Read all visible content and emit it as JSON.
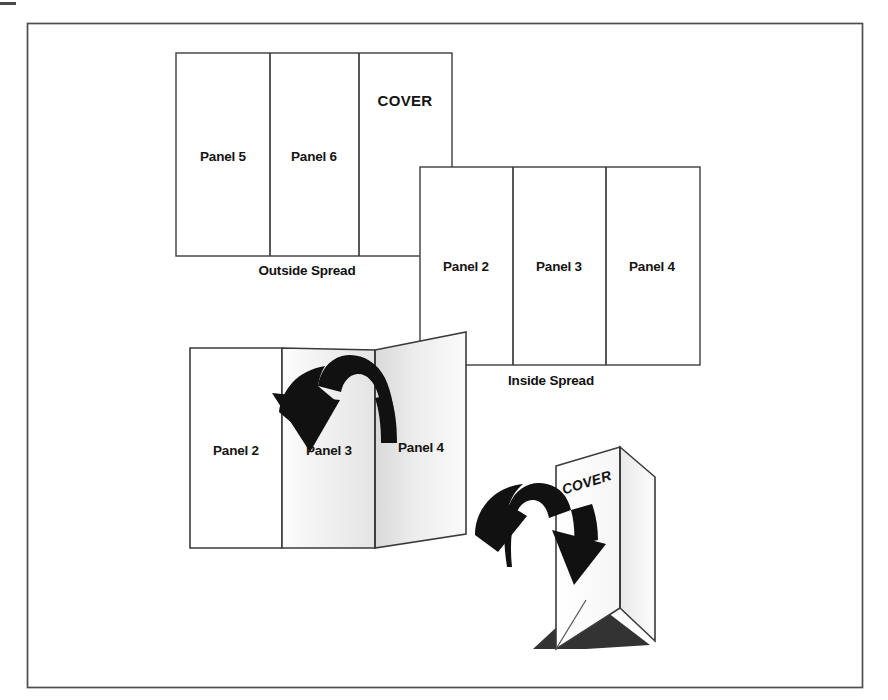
{
  "figure": {
    "frame": {
      "name": "outer-border",
      "x": 27,
      "y": 23,
      "width": 836,
      "height": 665,
      "stroke_color": "#4d4d4d"
    },
    "corner_tick": {
      "name": "crop-mark",
      "x": 0,
      "y": 2,
      "width": 16,
      "height": 3
    }
  },
  "outside_spread": {
    "caption": "Outside Spread",
    "panels": [
      {
        "label": "Panel 5"
      },
      {
        "label": "Panel 6"
      },
      {
        "label": "COVER"
      }
    ]
  },
  "inside_spread": {
    "caption": "Inside Spread",
    "panels": [
      {
        "label": "Panel 2"
      },
      {
        "label": "Panel 3"
      },
      {
        "label": "Panel 4"
      }
    ]
  },
  "folding_step_1": {
    "panels": [
      {
        "label": "Panel 2"
      },
      {
        "label": "Panel 3"
      },
      {
        "label": "Panel 4"
      }
    ],
    "arrow": {
      "name": "fold-arrow",
      "direction": "curved-down-left"
    }
  },
  "folding_step_2": {
    "cover_label": "COVER",
    "arrow": {
      "name": "fold-arrow",
      "direction": "curved-down-right"
    }
  },
  "colors": {
    "line": "#3b3b3b",
    "frame": "#4d4d4d",
    "ink": "#111111",
    "panel_fill": "#ffffff",
    "shade_light": "#f2f2f2",
    "shade_mid": "#dcdcdc",
    "shadow": "#333333"
  }
}
